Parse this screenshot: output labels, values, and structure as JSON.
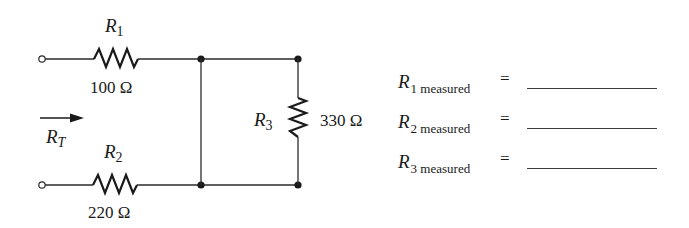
{
  "diagram": {
    "type": "circuit-schematic",
    "stroke_color": "#1a1a1a",
    "background": "#ffffff"
  },
  "components": {
    "r1": {
      "symbol": "R",
      "subscript": "1",
      "value": "100 Ω"
    },
    "r2": {
      "symbol": "R",
      "subscript": "2",
      "value": "220 Ω"
    },
    "r3": {
      "symbol": "R",
      "subscript": "3",
      "value": "330 Ω"
    }
  },
  "total_resistance": {
    "symbol": "R",
    "subscript": "T",
    "arrow": "right-arrow-icon"
  },
  "measurements": [
    {
      "symbol": "R",
      "subscript": "1 measured",
      "equals": "=",
      "value": ""
    },
    {
      "symbol": "R",
      "subscript": "2 measured",
      "equals": "=",
      "value": ""
    },
    {
      "symbol": "R",
      "subscript": "3 measured",
      "equals": "=",
      "value": ""
    }
  ]
}
